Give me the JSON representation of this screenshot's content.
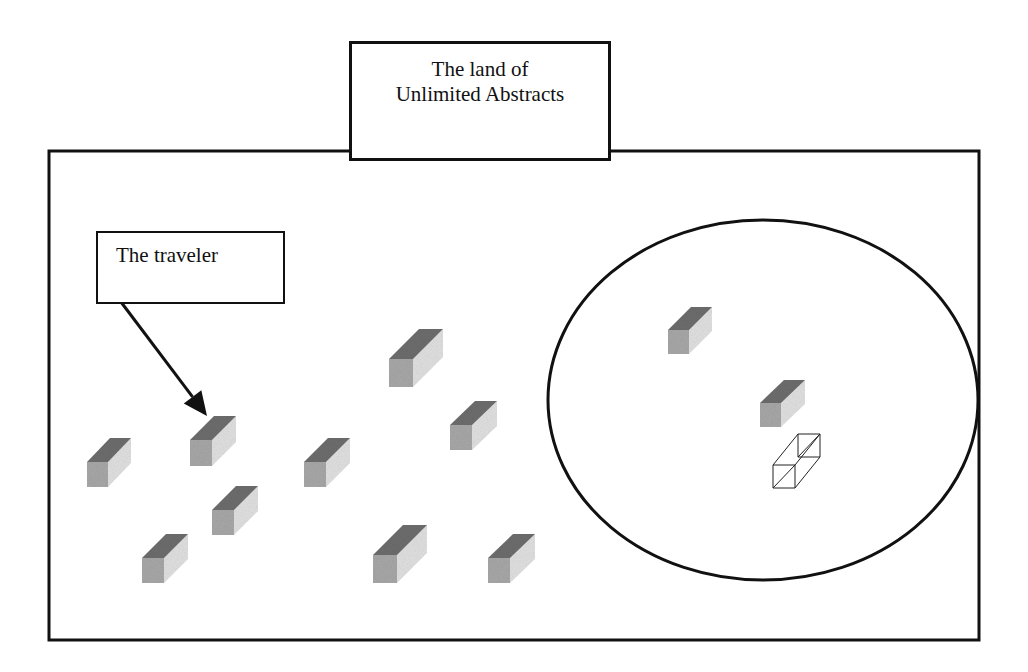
{
  "diagram": {
    "title": {
      "lines": [
        "The land of",
        "Unlimited Abstracts"
      ]
    },
    "traveler_label": "The traveler",
    "colors": {
      "stroke": "#111111",
      "block_top": "#6e6e6e",
      "block_front": "#a9a9a9",
      "block_side": "#e2e2e2",
      "wireframe": "#222222",
      "background": "#ffffff"
    },
    "land_frame": {
      "x": 49,
      "y": 151,
      "width": 930,
      "height": 489
    },
    "circle_region": {
      "cx": 763,
      "cy": 400,
      "rx": 215,
      "ry": 180
    },
    "arrow": {
      "from": [
        121,
        302
      ],
      "to": [
        207,
        416
      ]
    },
    "blocks": [
      {
        "id": "block-1",
        "x": 87,
        "y": 487,
        "w": 21,
        "h": 25,
        "dx": 23,
        "dy": -24,
        "region": "outside"
      },
      {
        "id": "block-traveler",
        "x": 190,
        "y": 466,
        "w": 22,
        "h": 26,
        "dx": 24,
        "dy": -24,
        "region": "outside",
        "is_traveler": true
      },
      {
        "id": "block-3",
        "x": 304,
        "y": 487,
        "w": 22,
        "h": 25,
        "dx": 24,
        "dy": -24,
        "region": "outside"
      },
      {
        "id": "block-4",
        "x": 389,
        "y": 387,
        "w": 24,
        "h": 28,
        "dx": 30,
        "dy": -30,
        "region": "outside"
      },
      {
        "id": "block-5",
        "x": 450,
        "y": 450,
        "w": 22,
        "h": 25,
        "dx": 25,
        "dy": -24,
        "region": "outside"
      },
      {
        "id": "block-6",
        "x": 212,
        "y": 535,
        "w": 22,
        "h": 25,
        "dx": 24,
        "dy": -24,
        "region": "outside"
      },
      {
        "id": "block-7",
        "x": 142,
        "y": 583,
        "w": 22,
        "h": 25,
        "dx": 24,
        "dy": -24,
        "region": "outside"
      },
      {
        "id": "block-8",
        "x": 373,
        "y": 583,
        "w": 24,
        "h": 28,
        "dx": 30,
        "dy": -30,
        "region": "outside"
      },
      {
        "id": "block-9",
        "x": 488,
        "y": 583,
        "w": 22,
        "h": 25,
        "dx": 25,
        "dy": -24,
        "region": "outside"
      },
      {
        "id": "block-circle-1",
        "x": 668,
        "y": 354,
        "w": 21,
        "h": 24,
        "dx": 23,
        "dy": -23,
        "region": "circle"
      },
      {
        "id": "block-circle-2",
        "x": 760,
        "y": 427,
        "w": 21,
        "h": 24,
        "dx": 24,
        "dy": -23,
        "region": "circle"
      }
    ],
    "wireframe_block": {
      "id": "wireframe-block",
      "x": 773,
      "y": 488,
      "w": 22,
      "h": 23,
      "dx": 25,
      "dy": -31,
      "region": "circle"
    }
  }
}
